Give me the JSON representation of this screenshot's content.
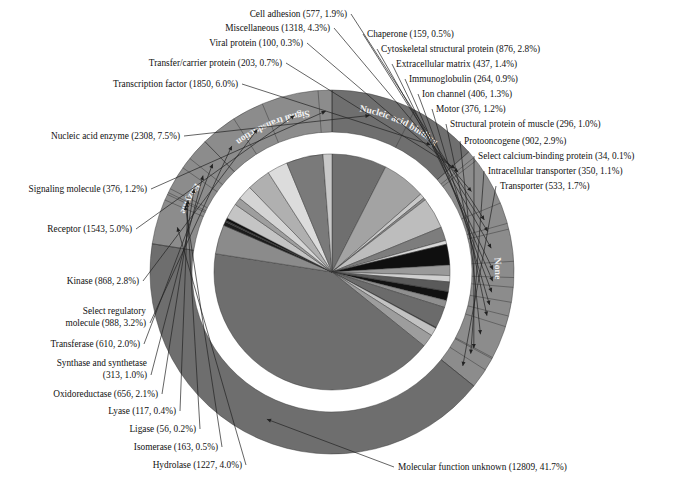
{
  "figure": {
    "total_label": "Molecular function unknown (12809, 41.7%)"
  },
  "chart_data": {
    "type": "pie",
    "xlabel": "",
    "ylabel": "",
    "legend_position": "callout-labels",
    "value_unit": "proteins",
    "categories": [
      "Nucleic acid enzyme",
      "Transcription factor",
      "Transfer/carrier protein",
      "Viral protein",
      "Miscellaneous",
      "Cell adhesion",
      "Chaperone",
      "Cytoskeletal structural protein",
      "Extracellular matrix",
      "Immunoglobulin",
      "Ion channel",
      "Motor",
      "Structural protein of muscle",
      "Protooncogene",
      "Select calcium-binding protein",
      "Intracellular transporter",
      "Transporter",
      "Molecular function unknown",
      "Hydrolase",
      "Isomerase",
      "Ligase",
      "Lyase",
      "Oxidoreductase",
      "Synthase and synthetase",
      "Transferase",
      "Select regulatory molecule",
      "Kinase",
      "Receptor",
      "Signaling molecule"
    ],
    "values": [
      2308,
      1850,
      203,
      100,
      1318,
      577,
      159,
      876,
      437,
      264,
      406,
      376,
      296,
      902,
      34,
      350,
      533,
      12809,
      1227,
      163,
      56,
      117,
      656,
      313,
      610,
      988,
      868,
      1543,
      376
    ],
    "percents": [
      7.5,
      6.0,
      0.7,
      0.3,
      4.3,
      1.9,
      0.5,
      2.8,
      1.4,
      0.9,
      1.3,
      1.2,
      1.0,
      2.9,
      0.1,
      1.1,
      1.7,
      41.7,
      4.0,
      0.5,
      0.2,
      0.4,
      2.1,
      1.0,
      2.0,
      3.2,
      2.8,
      5.0,
      1.2
    ],
    "grouping": [
      {
        "name": "Nucleic acid binding",
        "members": [
          "Nucleic acid enzyme",
          "Transcription factor"
        ],
        "percent": 13.5
      },
      {
        "name": "None",
        "members": [
          "Transfer/carrier protein",
          "Viral protein",
          "Miscellaneous",
          "Cell adhesion",
          "Chaperone",
          "Cytoskeletal structural protein",
          "Extracellular matrix",
          "Immunoglobulin",
          "Ion channel",
          "Motor",
          "Structural protein of muscle",
          "Protooncogene",
          "Select calcium-binding protein",
          "Intracellular transporter",
          "Transporter"
        ],
        "percent": 19.1
      },
      {
        "name": "Molecular function unknown",
        "members": [
          "Molecular function unknown"
        ],
        "percent": 41.7
      },
      {
        "name": "Enzyme",
        "members": [
          "Hydrolase",
          "Isomerase",
          "Ligase",
          "Lyase",
          "Oxidoreductase",
          "Synthase and synthetase",
          "Transferase"
        ],
        "percent": 10.2
      },
      {
        "name": "Signal transduction",
        "members": [
          "Select regulatory molecule",
          "Kinase",
          "Receptor",
          "Signaling molecule"
        ],
        "percent": 12.2
      }
    ]
  },
  "ring_labels": [
    {
      "id": "none",
      "text": "None"
    },
    {
      "id": "nucleic-acid-binding",
      "text": "Nucleic acid binding"
    },
    {
      "id": "signal-transduction",
      "text": "Signal transduction"
    },
    {
      "id": "enzyme",
      "text": "Enzyme"
    }
  ],
  "callouts": {
    "cell_adhesion": "Cell adhesion (577, 1.9%)",
    "miscellaneous": "Miscellaneous (1318, 4.3%)",
    "viral_protein": "Viral protein (100, 0.3%)",
    "transfer_carrier_protein": "Transfer/carrier protein (203, 0.7%)",
    "transcription_factor": "Transcription factor (1850, 6.0%)",
    "nucleic_acid_enzyme": "Nucleic acid enzyme (2308, 7.5%)",
    "signaling_molecule": "Signaling molecule (376, 1.2%)",
    "receptor": "Receptor (1543, 5.0%)",
    "kinase": "Kinase (868, 2.8%)",
    "select_regulatory_molecule_1": "Select regulatory",
    "select_regulatory_molecule_2": "molecule (988, 3.2%)",
    "transferase": "Transferase (610, 2.0%)",
    "synthase_and_synthetase_1": "Synthase and synthetase",
    "synthase_and_synthetase_2": "(313, 1.0%)",
    "oxidoreductase": "Oxidoreductase (656, 2.1%)",
    "lyase": "Lyase (117, 0.4%)",
    "ligase": "Ligase (56, 0.2%)",
    "isomerase": "Isomerase (163, 0.5%)",
    "hydrolase": "Hydrolase (1227, 4.0%)",
    "molecular_function_unknown": "Molecular function unknown (12809, 41.7%)",
    "chaperone": "Chaperone (159, 0.5%)",
    "cytoskeletal_structural_protein": "Cytoskeletal structural protein (876, 2.8%)",
    "extracellular_matrix": "Extracellular matrix (437, 1.4%)",
    "immunoglobulin": "Immunoglobulin (264, 0.9%)",
    "ion_channel": "Ion channel (406, 1.3%)",
    "motor": "Motor (376, 1.2%)",
    "structural_protein_of_muscle": "Structural protein of muscle (296, 1.0%)",
    "protooncogene": "Protooncogene (902, 2.9%)",
    "select_calcium_binding_protein": "Select calcium-binding protein (34, 0.1%)",
    "intracellular_transporter": "Intracellular transporter (350, 1.1%)",
    "transporter": "Transporter (533, 1.7%)"
  },
  "colors": {
    "background": "#ffffff",
    "text": "#111111",
    "stroke": "#333333",
    "unknown_gray": "#6e6e6e",
    "ring_label_text": "#f2f2f2",
    "palette": [
      "#6e6e6e",
      "#8d8d8d",
      "#b4b4b4",
      "#d2d2d2",
      "#a0a0a0",
      "#c6c6c6",
      "#4a4a4a",
      "#151515",
      "#e2e2e2",
      "#787878"
    ]
  }
}
